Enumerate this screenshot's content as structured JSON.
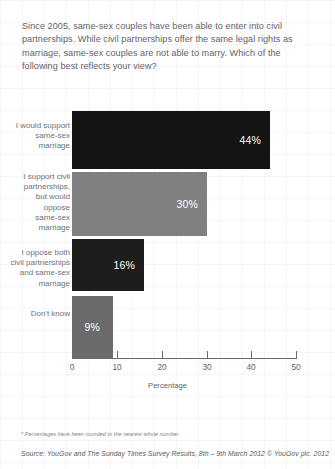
{
  "question": "Since 2005, same-sex couples have been able to enter into civil partnerships. While civil partnerships offer the same legal rights as marriage, same-sex couples are not able to marry. Which of the following best reflects your view?",
  "footnote": "* Percentages have been rounded to the nearest whole number",
  "source": "Source: YouGov and The Sunday Times Survey Results, 8th – 9th March 2012 © YouGov plc. 2012",
  "chart_data": {
    "type": "bar",
    "orientation": "horizontal",
    "title": "",
    "xlabel": "Percentage",
    "ylabel": "",
    "xlim": [
      0,
      50
    ],
    "xticks": [
      0,
      10,
      20,
      30,
      40,
      50
    ],
    "xtick_labels": [
      "0",
      "10",
      "20",
      "30",
      "40",
      "50"
    ],
    "grid": false,
    "legend": "none",
    "categories": [
      "I would support same-sex marriage",
      "I support civil partnerships, but would oppose same-sex marriage",
      "I oppose both civil partnerships and same-sex marriage",
      "Don't know"
    ],
    "values": [
      44,
      30,
      16,
      9
    ],
    "data_labels": [
      "44%",
      "30%",
      "16%",
      "9%"
    ],
    "bar_colors": [
      "#141414",
      "#808080",
      "#1d1d1d",
      "#6b6b6b"
    ],
    "category_lines": [
      [
        "I would support",
        "same-sex",
        "marriage"
      ],
      [
        "I support civil",
        "partnerships,",
        "but would",
        "oppose",
        "same-sex",
        "marriage"
      ],
      [
        "I oppose both",
        "civil partnerships",
        "and same-sex",
        "marriage"
      ],
      [
        "Don't know"
      ]
    ]
  }
}
